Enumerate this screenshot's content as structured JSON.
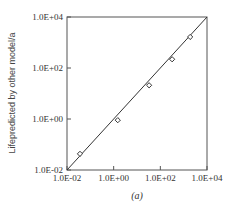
{
  "chart_data": {
    "type": "scatter",
    "title": "",
    "caption": "(a)",
    "xlabel": "",
    "ylabel": "Lifepredicted by other model/a",
    "xscale": "log",
    "yscale": "log",
    "xlim": [
      0.01,
      10000
    ],
    "ylim": [
      0.01,
      10000
    ],
    "x_ticks": [
      "1.0E-02",
      "1.0E+00",
      "1.0E+02",
      "1.0E+04"
    ],
    "y_ticks": [
      "1.0E-02",
      "1.0E+00",
      "1.0E+02",
      "1.0E+04"
    ],
    "grid": false,
    "legend": null,
    "series": [
      {
        "name": "data points",
        "marker": "open-diamond",
        "x": [
          0.036,
          1.5,
          33,
          320,
          1900
        ],
        "y": [
          0.043,
          0.9,
          21,
          220,
          1650
        ]
      },
      {
        "name": "1:1 reference line",
        "style": "line",
        "x": [
          0.01,
          10000
        ],
        "y": [
          0.01,
          10000
        ]
      }
    ]
  },
  "colors": {
    "axis": "#555555",
    "line": "#333333",
    "marker": "#333333"
  }
}
